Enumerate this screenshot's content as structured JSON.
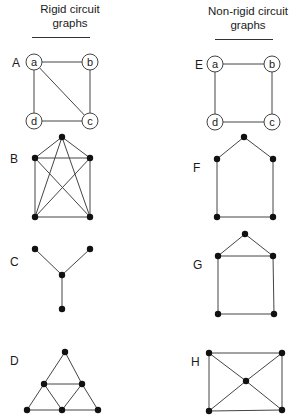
{
  "headers": {
    "rigid": {
      "line1": "Rigid circuit",
      "line2": "graphs"
    },
    "nonrigid": {
      "line1": "Non-rigid circuit",
      "line2": "graphs"
    }
  },
  "colors": {
    "edge": "#444444",
    "node": "#111111",
    "text": "#1a1a1a",
    "background": "#ffffff"
  },
  "graphs": [
    {
      "id": "A",
      "label": "A",
      "column": "rigid",
      "labelPos": [
        12,
        67
      ],
      "labeled": true,
      "nodes": [
        {
          "id": "a",
          "x": 34,
          "y": 62
        },
        {
          "id": "b",
          "x": 90,
          "y": 62
        },
        {
          "id": "c",
          "x": 90,
          "y": 121
        },
        {
          "id": "d",
          "x": 34,
          "y": 121
        }
      ],
      "edges": [
        [
          "a",
          "b"
        ],
        [
          "b",
          "c"
        ],
        [
          "c",
          "d"
        ],
        [
          "d",
          "a"
        ],
        [
          "a",
          "c"
        ]
      ]
    },
    {
      "id": "E",
      "label": "E",
      "column": "nonrigid",
      "labelPos": [
        195,
        69
      ],
      "labeled": true,
      "nodes": [
        {
          "id": "a",
          "x": 215,
          "y": 64
        },
        {
          "id": "b",
          "x": 272,
          "y": 64
        },
        {
          "id": "c",
          "x": 272,
          "y": 122
        },
        {
          "id": "d",
          "x": 215,
          "y": 122
        }
      ],
      "edges": [
        [
          "a",
          "b"
        ],
        [
          "b",
          "c"
        ],
        [
          "c",
          "d"
        ],
        [
          "d",
          "a"
        ]
      ]
    },
    {
      "id": "B",
      "label": "B",
      "column": "rigid",
      "labelPos": [
        10,
        163
      ],
      "labeled": false,
      "nodes": [
        {
          "id": "1",
          "x": 62,
          "y": 137
        },
        {
          "id": "2",
          "x": 35,
          "y": 158
        },
        {
          "id": "3",
          "x": 90,
          "y": 158
        },
        {
          "id": "4",
          "x": 35,
          "y": 217
        },
        {
          "id": "5",
          "x": 90,
          "y": 217
        }
      ],
      "edges": [
        [
          "1",
          "2"
        ],
        [
          "1",
          "3"
        ],
        [
          "1",
          "4"
        ],
        [
          "1",
          "5"
        ],
        [
          "2",
          "3"
        ],
        [
          "2",
          "4"
        ],
        [
          "2",
          "5"
        ],
        [
          "3",
          "4"
        ],
        [
          "3",
          "5"
        ],
        [
          "4",
          "5"
        ]
      ]
    },
    {
      "id": "F",
      "label": "F",
      "column": "nonrigid",
      "labelPos": [
        193,
        172
      ],
      "labeled": false,
      "nodes": [
        {
          "id": "1",
          "x": 244,
          "y": 137
        },
        {
          "id": "2",
          "x": 217,
          "y": 159
        },
        {
          "id": "3",
          "x": 273,
          "y": 159
        },
        {
          "id": "4",
          "x": 217,
          "y": 217
        },
        {
          "id": "5",
          "x": 273,
          "y": 217
        }
      ],
      "edges": [
        [
          "1",
          "2"
        ],
        [
          "1",
          "3"
        ],
        [
          "2",
          "4"
        ],
        [
          "3",
          "5"
        ],
        [
          "4",
          "5"
        ]
      ]
    },
    {
      "id": "C",
      "label": "C",
      "column": "rigid",
      "labelPos": [
        10,
        266
      ],
      "labeled": false,
      "nodes": [
        {
          "id": "1",
          "x": 35,
          "y": 249
        },
        {
          "id": "2",
          "x": 90,
          "y": 249
        },
        {
          "id": "3",
          "x": 62,
          "y": 275
        },
        {
          "id": "4",
          "x": 62,
          "y": 309
        }
      ],
      "edges": [
        [
          "1",
          "3"
        ],
        [
          "2",
          "3"
        ],
        [
          "3",
          "4"
        ]
      ]
    },
    {
      "id": "G",
      "label": "G",
      "column": "nonrigid",
      "labelPos": [
        193,
        269
      ],
      "labeled": false,
      "nodes": [
        {
          "id": "1",
          "x": 245,
          "y": 234
        },
        {
          "id": "2",
          "x": 218,
          "y": 256
        },
        {
          "id": "3",
          "x": 273,
          "y": 256
        },
        {
          "id": "4",
          "x": 218,
          "y": 314
        },
        {
          "id": "5",
          "x": 274,
          "y": 314
        }
      ],
      "edges": [
        [
          "1",
          "2"
        ],
        [
          "1",
          "3"
        ],
        [
          "2",
          "3"
        ],
        [
          "2",
          "4"
        ],
        [
          "3",
          "5"
        ],
        [
          "4",
          "5"
        ]
      ]
    },
    {
      "id": "D",
      "label": "D",
      "column": "rigid",
      "labelPos": [
        10,
        365
      ],
      "labeled": false,
      "nodes": [
        {
          "id": "1",
          "x": 65,
          "y": 352
        },
        {
          "id": "2",
          "x": 44,
          "y": 384
        },
        {
          "id": "3",
          "x": 82,
          "y": 384
        },
        {
          "id": "4",
          "x": 27,
          "y": 410
        },
        {
          "id": "5",
          "x": 62,
          "y": 410
        },
        {
          "id": "6",
          "x": 98,
          "y": 410
        }
      ],
      "edges": [
        [
          "1",
          "2"
        ],
        [
          "1",
          "3"
        ],
        [
          "2",
          "3"
        ],
        [
          "2",
          "4"
        ],
        [
          "2",
          "5"
        ],
        [
          "3",
          "5"
        ],
        [
          "3",
          "6"
        ],
        [
          "4",
          "5"
        ],
        [
          "5",
          "6"
        ]
      ]
    },
    {
      "id": "H",
      "label": "H",
      "column": "nonrigid",
      "labelPos": [
        191,
        366
      ],
      "labeled": false,
      "nodes": [
        {
          "id": "1",
          "x": 209,
          "y": 353
        },
        {
          "id": "2",
          "x": 282,
          "y": 353
        },
        {
          "id": "3",
          "x": 246,
          "y": 381
        },
        {
          "id": "4",
          "x": 209,
          "y": 411
        },
        {
          "id": "5",
          "x": 282,
          "y": 410
        }
      ],
      "edges": [
        [
          "1",
          "2"
        ],
        [
          "1",
          "4"
        ],
        [
          "2",
          "5"
        ],
        [
          "4",
          "5"
        ],
        [
          "1",
          "3"
        ],
        [
          "2",
          "3"
        ],
        [
          "3",
          "4"
        ],
        [
          "3",
          "5"
        ]
      ]
    }
  ]
}
